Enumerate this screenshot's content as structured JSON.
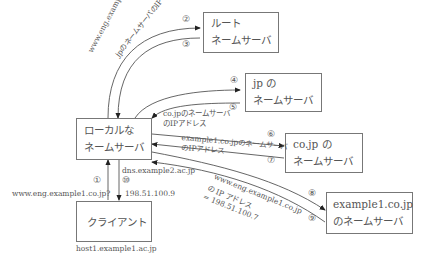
{
  "boxes": {
    "root": {
      "line1": "ルート",
      "line2": "ネームサーバ"
    },
    "jp": {
      "line1": "jp の",
      "line2": "ネームサーバ"
    },
    "local": {
      "line1": "ローカルな",
      "line2": "ネームサーバ"
    },
    "cojp": {
      "line1": "co.jp の",
      "line2": "ネームサーバ"
    },
    "example1": {
      "line1": "example1.co.jp",
      "line2": "のネームサーバ"
    },
    "client": {
      "line1": "クライアント"
    }
  },
  "host_labels": {
    "local_host": "dns.example2.ac.jp",
    "client_host": "host1.example1.ac.jp"
  },
  "steps": [
    {
      "num": "①",
      "label": "www.eng.example1.co.jp?"
    },
    {
      "num": "②",
      "label": "www.eng.example1.co.jp?"
    },
    {
      "num": "③",
      "label": "jpのネームサーバのIPアドレス"
    },
    {
      "num": "④",
      "label": ""
    },
    {
      "num": "⑤",
      "label1": "co.jpのネームサーバ",
      "label2": "のIPアドレス"
    },
    {
      "num": "⑥",
      "label": "example1.co.jpのネームサーバ"
    },
    {
      "num": "⑦",
      "label": "のIPアドレス"
    },
    {
      "num": "⑧",
      "label1": "www.eng.example1.co.jp",
      "label2": "の IP アドレス",
      "label3": "= 198.51.100.7"
    },
    {
      "num": "⑨",
      "label": ""
    },
    {
      "num": "⑩",
      "label": "198.51.100.9"
    }
  ]
}
